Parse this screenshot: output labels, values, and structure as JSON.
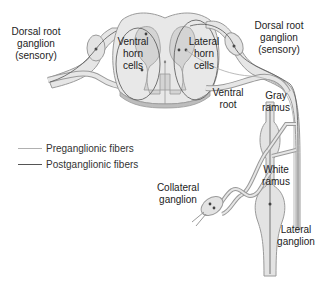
{
  "labels": {
    "dorsal_root_ganglion_left": "Dorsal root\nganglion\n(sensory)",
    "ventral_horn_cells": "Ventral\nhorn\ncells",
    "lateral_horn_cells": "Lateral\nhorn\ncells",
    "dorsal_root_ganglion_right": "Dorsal root\nganglion\n(sensory)",
    "ventral_root": "Ventral\nroot",
    "gray_ramus": "Gray\nramus",
    "white_ramus": "White\nramus",
    "collateral_ganglion": "Collateral\nganglion",
    "lateral_ganglion": "Lateral\nganglion"
  },
  "legend": {
    "items": [
      {
        "label": "Preganglionic fibers",
        "color": "#b0b0b0"
      },
      {
        "label": "Postganglionic fibers",
        "color": "#555555"
      }
    ]
  },
  "colors": {
    "tissue_fill": "#e3e3e3",
    "tissue_stroke": "#9a9a9a",
    "gray_matter": "#d2d2d2",
    "fiber_dark": "#444444",
    "fiber_light": "#a8a8a8"
  }
}
